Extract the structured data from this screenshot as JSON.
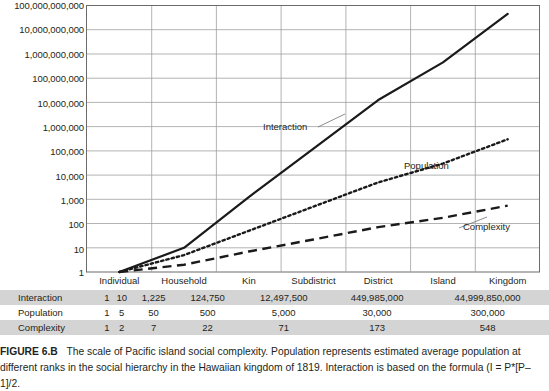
{
  "chart_data": {
    "type": "line",
    "title": "",
    "xlabel": "",
    "ylabel": "",
    "log_y": true,
    "ylim": [
      1,
      100000000000
    ],
    "grid": true,
    "legend_position": "inline-annotations",
    "categories": [
      "Individual",
      "Household",
      "Kin",
      "Subdistrict",
      "District",
      "Island",
      "Kingdom"
    ],
    "ytick_labels": [
      "100,000,000,000",
      "10,000,000,000",
      "1,000,000,000",
      "100,000,000",
      "10,000,000",
      "1,000,000",
      "100,000",
      "10,000",
      "1,000",
      "100",
      "10",
      "1"
    ],
    "ytick_values": [
      100000000000,
      10000000000,
      1000000000,
      100000000,
      10000000,
      1000000,
      100000,
      10000,
      1000,
      100,
      10,
      1
    ],
    "series": [
      {
        "name": "Interaction",
        "style": "solid",
        "values": [
          1,
          10,
          1225,
          124750,
          12497500,
          449985000,
          44999850000
        ]
      },
      {
        "name": "Population",
        "style": "dotted",
        "values": [
          1,
          5,
          50,
          500,
          5000,
          30000,
          300000
        ]
      },
      {
        "name": "Complexity",
        "style": "dashed",
        "values": [
          1,
          2,
          7,
          22,
          71,
          173,
          548
        ]
      }
    ],
    "annotations": [
      {
        "text": "Interaction",
        "x": 263,
        "y": 128
      },
      {
        "text": "Population",
        "x": 404,
        "y": 167
      },
      {
        "text": "Complexity",
        "x": 463,
        "y": 228
      }
    ]
  },
  "table": {
    "columns": [
      "Individual",
      "Household",
      "Kin",
      "Subdistrict",
      "District",
      "Island",
      "Kingdom"
    ],
    "rows": [
      {
        "label": "Interaction",
        "shaded": true,
        "cells": [
          "1",
          "10",
          "1,225",
          "124,750",
          "12,497,500",
          "449,985,000",
          "44,999,850,000"
        ]
      },
      {
        "label": "Population",
        "shaded": false,
        "cells": [
          "1",
          "5",
          "50",
          "500",
          "5,000",
          "30,000",
          "300,000"
        ]
      },
      {
        "label": "Complexity",
        "shaded": true,
        "cells": [
          "1",
          "2",
          "7",
          "22",
          "71",
          "173",
          "548"
        ]
      }
    ]
  },
  "caption": {
    "figure_number": "FIGURE 6.B",
    "text": "The scale of Pacific island social complexity. Population represents estimated average population at different ranks in the social hierarchy in the Hawaiian kingdom of 1819. Interaction is based on the formula (I = P*[P–1]/2."
  },
  "colors": {
    "line": "#1a1a1a",
    "grid": "#9a9a9a",
    "axis": "#5a5a5a",
    "table_shaded": "#d4d4d4",
    "text": "#231f20"
  }
}
